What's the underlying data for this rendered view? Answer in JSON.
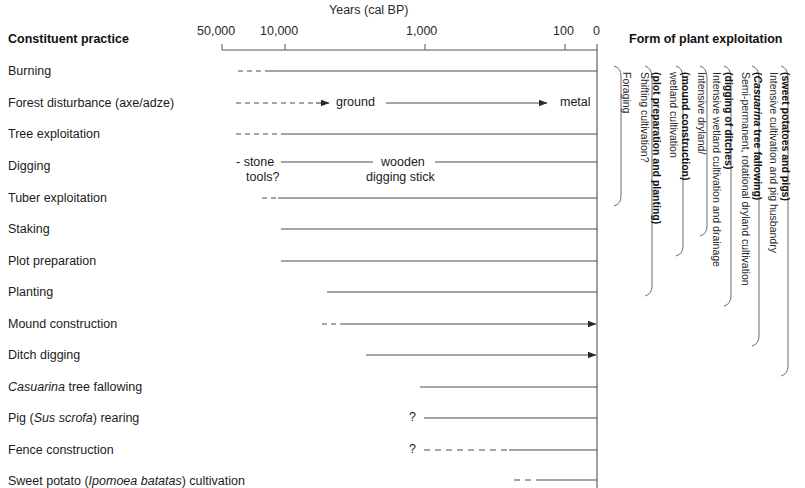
{
  "figure": {
    "axis_title": "Years (cal BP)",
    "left_column_header": "Constituent practice",
    "right_column_header": "Form of plant exploitation"
  },
  "axis": {
    "ticks": [
      {
        "label": "50,000",
        "x": 222
      },
      {
        "label": "10,000",
        "x": 285
      },
      {
        "label": "1,000",
        "x": 425
      },
      {
        "label": "100",
        "x": 565
      },
      {
        "label": "0",
        "x": 597
      }
    ],
    "line_start_x": 222,
    "line_end_x": 597,
    "line_y": 50
  },
  "rows": [
    {
      "label": "Burning",
      "y": 71
    },
    {
      "label": "Forest disturbance (axe/adze)",
      "y": 103
    },
    {
      "label": "Tree exploitation",
      "y": 134
    },
    {
      "label": "Digging",
      "y": 166
    },
    {
      "label": "Tuber exploitation",
      "y": 198
    },
    {
      "label": "Staking",
      "y": 229
    },
    {
      "label": "Plot preparation",
      "y": 261
    },
    {
      "label": "Planting",
      "y": 292
    },
    {
      "label": "Mound construction",
      "y": 324
    },
    {
      "label": "Ditch digging",
      "y": 355
    },
    {
      "label": "Casuarina tree fallowing",
      "y": 387,
      "italic_prefix": "Casuarina",
      "rest": " tree fallowing"
    },
    {
      "label": "Pig (Sus scrofa) rearing",
      "y": 418,
      "pre": "Pig (",
      "italic": "Sus scrofa",
      "post": ") rearing"
    },
    {
      "label": "Fence construction",
      "y": 450
    },
    {
      "label": "Sweet potato (Ipomoea batatas) cultivation",
      "y": 481,
      "pre": "Sweet potato (",
      "italic": "Ipomoea batatas",
      "post": ") cultivation"
    }
  ],
  "inline_notes": [
    {
      "text": "ground",
      "x": 336,
      "y": 102
    },
    {
      "text": "metal",
      "x": 560,
      "y": 102
    },
    {
      "text": "- stone",
      "x": 236,
      "y": 165
    },
    {
      "text": "tools?",
      "x": 246,
      "y": 180
    },
    {
      "text": "wooden",
      "x": 381,
      "y": 165
    },
    {
      "text": "digging stick",
      "x": 366,
      "y": 180
    },
    {
      "text": "?",
      "x": 411,
      "y": 417
    },
    {
      "text": "?",
      "x": 411,
      "y": 449
    }
  ],
  "groups": [
    {
      "id": "foraging",
      "label": "Foraging",
      "bold": false
    },
    {
      "id": "shifting-cultivation",
      "label_plain": "Shifting cultivation?",
      "label_bold": "(plot preparation and planting)"
    },
    {
      "id": "wetland-cultivation",
      "label_plain": "wetland cultivation",
      "label_bold": "(mound construction)"
    },
    {
      "id": "intensive-dryland",
      "label_plain": "Intensive dryland/"
    },
    {
      "id": "intensive-wetland",
      "label_plain": "Intensive wetland cultivation and drainage",
      "label_bold": "(digging of ditches)"
    },
    {
      "id": "semi-permanent",
      "label_plain": "Semi-permanent, rotational dryland cultivation",
      "label_bold_italic": "Casuarina",
      "label_bold2": " tree fallowing)",
      "label_bold_open": "("
    },
    {
      "id": "intensive-pig",
      "label_plain": "Intensive cultivation and pig husbandry",
      "label_bold": "(sweet potatoes and pigs)"
    }
  ],
  "colors": {
    "line": "#4a4a4a",
    "text": "#1b1b1b",
    "axis": "#555555",
    "bracket": "#6b6b6b"
  }
}
